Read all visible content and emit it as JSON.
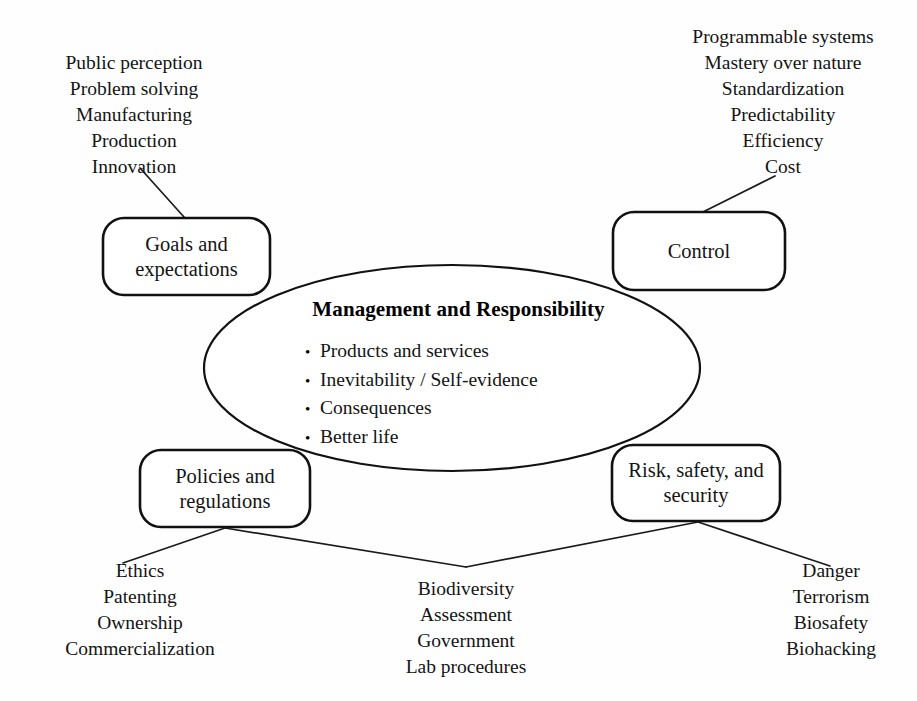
{
  "diagram": {
    "title": "Management and Responsibility",
    "core": {
      "heading": "Management and Responsibility",
      "bullets": [
        "Products and services",
        "Inevitability / Self-evidence",
        "Consequences",
        "Better life"
      ],
      "bullet_glyph": "•"
    },
    "nodes": [
      {
        "id": "goals",
        "label": "Goals and\nexpectations",
        "line1": "Goals and",
        "line2": "expectations"
      },
      {
        "id": "control",
        "label": "Control",
        "line1": "Control",
        "line2": ""
      },
      {
        "id": "policies",
        "label": "Policies and\nregulations",
        "line1": "Policies and",
        "line2": "regulations"
      },
      {
        "id": "risk",
        "label": "Risk, safety, and\nsecurity",
        "line1": "Risk, safety, and",
        "line2": "security"
      }
    ],
    "satellites": {
      "top_left": {
        "attached_to": "goals",
        "items": [
          "Public perception",
          "Problem solving",
          "Manufacturing",
          "Production",
          "Innovation"
        ]
      },
      "top_right": {
        "attached_to": "control",
        "items": [
          "Programmable systems",
          "Mastery over nature",
          "Standardization",
          "Predictability",
          "Efficiency",
          "Cost"
        ]
      },
      "bottom_left": {
        "attached_to": "policies",
        "items": [
          "Ethics",
          "Patenting",
          "Ownership",
          "Commercialization"
        ]
      },
      "bottom_center": {
        "attached_to": "policies-and-risk",
        "items": [
          "Biodiversity",
          "Assessment",
          "Government",
          "Lab procedures"
        ]
      },
      "bottom_right": {
        "attached_to": "risk",
        "items": [
          "Danger",
          "Terrorism",
          "Biosafety",
          "Biohacking"
        ]
      }
    },
    "colors": {
      "background": "#fefefe",
      "stroke": "#111111",
      "text": "#141414"
    }
  }
}
